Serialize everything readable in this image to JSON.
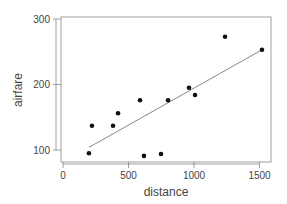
{
  "chart_data": {
    "type": "scatter",
    "title": "",
    "xlabel": "distance",
    "ylabel": "airfare",
    "xlim": [
      0,
      1600
    ],
    "ylim": [
      85,
      305
    ],
    "xticks": [
      0,
      500,
      1000,
      1500
    ],
    "yticks": [
      100,
      200,
      300
    ],
    "grid": false,
    "legend": null,
    "points": [
      {
        "x": 198,
        "y": 95
      },
      {
        "x": 221,
        "y": 137
      },
      {
        "x": 382,
        "y": 137
      },
      {
        "x": 420,
        "y": 156
      },
      {
        "x": 588,
        "y": 176
      },
      {
        "x": 618,
        "y": 91
      },
      {
        "x": 748,
        "y": 94
      },
      {
        "x": 802,
        "y": 176
      },
      {
        "x": 962,
        "y": 195
      },
      {
        "x": 1008,
        "y": 184
      },
      {
        "x": 1237,
        "y": 273
      },
      {
        "x": 1519,
        "y": 253
      }
    ],
    "fit_line": {
      "x": [
        198,
        1519
      ],
      "y": [
        104,
        253
      ]
    }
  },
  "colors": {
    "points": "#111111",
    "line": "#777777",
    "axis": "#666666",
    "text": "#444444"
  }
}
